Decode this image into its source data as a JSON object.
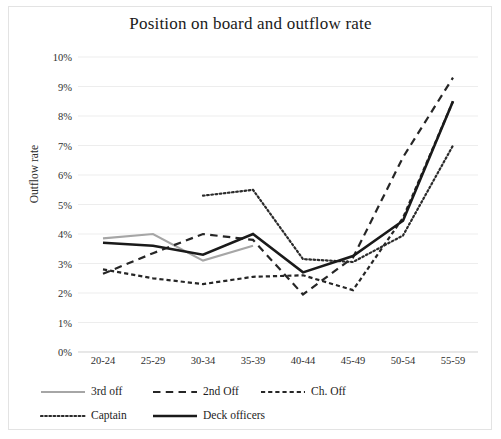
{
  "chart_data": {
    "type": "line",
    "title": "Position on board and outflow rate",
    "xlabel": "",
    "ylabel": "Outflow rate",
    "categories": [
      "20-24",
      "25-29",
      "30-34",
      "35-39",
      "40-44",
      "45-49",
      "50-54",
      "55-59"
    ],
    "ylim": [
      0,
      10
    ],
    "ytick_labels": [
      "0%",
      "1%",
      "2%",
      "3%",
      "4%",
      "5%",
      "6%",
      "7%",
      "8%",
      "9%",
      "10%"
    ],
    "ytick_values": [
      0,
      1,
      2,
      3,
      4,
      5,
      6,
      7,
      8,
      9,
      10
    ],
    "grid": true,
    "legend_position": "bottom",
    "value_unit": "percent",
    "series": [
      {
        "name": "3rd off",
        "style": "solid",
        "color": "#a6a6a6",
        "width": 2.2,
        "values": [
          3.85,
          4.0,
          3.1,
          3.6,
          null,
          null,
          null,
          null
        ]
      },
      {
        "name": "2nd Off",
        "style": "dashed-long",
        "color": "#262626",
        "width": 2.2,
        "values": [
          2.65,
          3.35,
          4.0,
          3.8,
          1.95,
          3.2,
          6.6,
          9.3
        ]
      },
      {
        "name": "Ch. Off",
        "style": "dashed-short",
        "color": "#262626",
        "width": 2.2,
        "values": [
          2.8,
          2.5,
          2.3,
          2.55,
          2.6,
          2.1,
          4.55,
          8.5
        ]
      },
      {
        "name": "Captain",
        "style": "dotted",
        "color": "#2b2b2b",
        "width": 2.2,
        "values": [
          null,
          null,
          5.3,
          5.5,
          3.15,
          3.05,
          3.95,
          7.0
        ]
      },
      {
        "name": "Deck officers",
        "style": "solid",
        "color": "#1a1a1a",
        "width": 2.6,
        "values": [
          3.7,
          3.6,
          3.3,
          4.0,
          2.7,
          3.25,
          4.45,
          8.5
        ]
      }
    ]
  },
  "legend": {
    "rows": [
      [
        {
          "label": "3rd off",
          "series": 0
        },
        {
          "label": "2nd Off",
          "series": 1
        },
        {
          "label": "Ch. Off",
          "series": 2
        }
      ],
      [
        {
          "label": "Captain",
          "series": 3
        },
        {
          "label": "Deck officers",
          "series": 4
        }
      ]
    ]
  }
}
